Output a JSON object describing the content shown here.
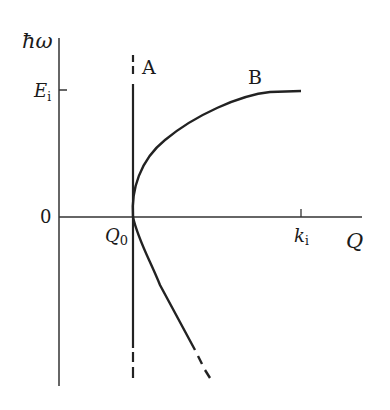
{
  "diagram": {
    "y_axis_label": "ħω",
    "x_axis_label": "Q",
    "y_ticks": [
      {
        "label_main": "E",
        "label_sub": "i"
      },
      {
        "label_main": "0",
        "label_sub": ""
      }
    ],
    "x_ticks": [
      {
        "label_main": "Q",
        "label_sub": "0"
      },
      {
        "label_main": "k",
        "label_sub": "i"
      }
    ],
    "curves": [
      {
        "name": "A",
        "label": "A",
        "description": "vertical line at Q0, dashed at both ends"
      },
      {
        "name": "B",
        "label": "B",
        "description": "branch rising from Q0 to E_i at k_i, plus lower branch continuing downward, dashed at end"
      }
    ],
    "colors": {
      "line": "#1a1a1a",
      "background": "#ffffff"
    }
  }
}
